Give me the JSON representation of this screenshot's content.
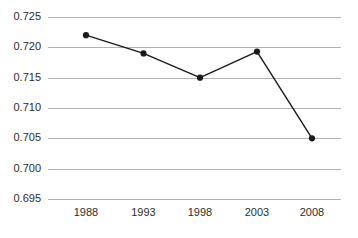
{
  "chart_data": {
    "type": "line",
    "title": "",
    "subtitle": "",
    "xlabel": "",
    "ylabel": "",
    "categories": [
      "1988",
      "1993",
      "1998",
      "2003",
      "2008"
    ],
    "x": [
      1988,
      1993,
      1998,
      2003,
      2008
    ],
    "values": [
      0.722,
      0.719,
      0.715,
      0.7193,
      0.705
    ],
    "series": [
      {
        "name": "",
        "values": [
          0.722,
          0.719,
          0.715,
          0.7193,
          0.705
        ]
      }
    ],
    "ylim": [
      0.695,
      0.725
    ],
    "yticks": [
      0.695,
      0.7,
      0.705,
      0.71,
      0.715,
      0.72,
      0.725
    ],
    "ytick_labels": [
      "0.695",
      "0.700",
      "0.705",
      "0.710",
      "0.715",
      "0.720",
      "0.725"
    ],
    "xtick_labels": [
      "1988",
      "1993",
      "1998",
      "2003",
      "2008"
    ],
    "grid": true,
    "grid_axis": "y",
    "legend": false,
    "legend_position": "none",
    "annotations": [],
    "colors": {
      "background": "#ffffff",
      "gridline": "#b3b3b3",
      "line": "#1a1a1a",
      "marker": "#1a1a1a",
      "tick_label": "#2b2b2b"
    },
    "marker_style": "circle",
    "marker_size": 3.1
  }
}
